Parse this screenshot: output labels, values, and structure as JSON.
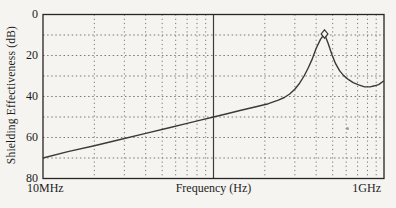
{
  "figure": {
    "background": "#f5f4f0",
    "ink": "#1c1c1c"
  },
  "chart_data": {
    "type": "line",
    "title": "",
    "xlabel": "Frequency (Hz)",
    "ylabel": "Shielding Effectiveness (dB)",
    "x_scale": "log",
    "x_range_hz": [
      10000000.0,
      1000000000.0
    ],
    "x_min_label": "10MHz",
    "x_max_label": "1GHz",
    "ylim": [
      0,
      80
    ],
    "y_axis_reversed": true,
    "y_tick_labels": [
      0,
      20,
      40,
      60,
      80
    ],
    "y_grid_db": [
      10,
      20,
      30,
      40,
      50,
      60,
      70
    ],
    "x_minor_grid_multipliers": [
      2,
      3,
      4,
      5,
      6,
      7,
      8,
      9
    ],
    "solid_vline_hz": 100000000.0,
    "grid_style": "dotted",
    "legend": "none",
    "series": [
      {
        "name": "shielding-effectiveness",
        "points_mhz_db": [
          [
            10,
            70
          ],
          [
            14,
            66.9
          ],
          [
            20,
            64
          ],
          [
            28,
            61.1
          ],
          [
            40,
            58
          ],
          [
            55,
            55.2
          ],
          [
            70,
            53.1
          ],
          [
            85,
            51.4
          ],
          [
            100,
            50
          ],
          [
            120,
            48.4
          ],
          [
            145,
            46.7
          ],
          [
            175,
            45.1
          ],
          [
            210,
            43.5
          ],
          [
            240,
            41.8
          ],
          [
            260,
            40.5
          ],
          [
            280,
            38.8
          ],
          [
            300,
            36.5
          ],
          [
            320,
            33.5
          ],
          [
            340,
            30
          ],
          [
            360,
            26
          ],
          [
            380,
            21.5
          ],
          [
            400,
            16.5
          ],
          [
            425,
            12
          ],
          [
            448,
            9.5
          ],
          [
            470,
            14
          ],
          [
            495,
            19.5
          ],
          [
            520,
            24
          ],
          [
            550,
            27.5
          ],
          [
            580,
            29.8
          ],
          [
            620,
            31.8
          ],
          [
            660,
            33.2
          ],
          [
            710,
            34.3
          ],
          [
            770,
            35.3
          ],
          [
            830,
            35.3
          ],
          [
            880,
            34.8
          ],
          [
            930,
            34.2
          ],
          [
            1000,
            32.3
          ]
        ]
      }
    ],
    "peak_marker": {
      "shape": "diamond",
      "mhz": 448,
      "db": 9.5
    },
    "colors": {
      "curve": "#3a3a3a",
      "grid_dots": "#6b6b6b",
      "frame": "#262626",
      "solid_vline": "#3c3c3c"
    }
  }
}
